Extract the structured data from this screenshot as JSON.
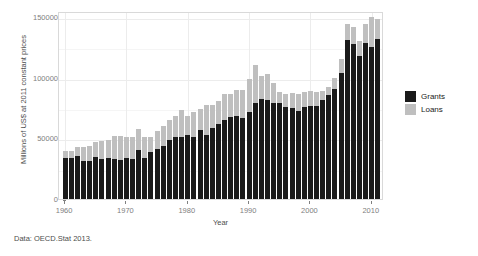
{
  "figure": {
    "title_cut": "",
    "caption": "Data: OECD.Stat 2013.",
    "colors": {
      "grants": "#1a1a1a",
      "loans": "#bfbfbf",
      "panel_background": "#ffffff",
      "panel_border": "#d9d9d9",
      "gridline": "#ececec",
      "axis_text": "#808080",
      "label_text": "#4d4d4d"
    }
  },
  "legend": {
    "entries": [
      {
        "label": "Grants",
        "color": "#1a1a1a"
      },
      {
        "label": "Loans",
        "color": "#bfbfbf"
      }
    ]
  },
  "chart_data": {
    "type": "bar",
    "title": "",
    "xlabel": "Year",
    "ylabel": "Millions of US$ at 2011 constant prices",
    "stacked": true,
    "grid": true,
    "legend_position": "right",
    "xlim": [
      1959,
      2012
    ],
    "ylim": [
      0,
      155000
    ],
    "ytick_labels": [
      "0",
      "50000",
      "100000",
      "150000"
    ],
    "ytick_values": [
      0,
      50000,
      100000,
      150000
    ],
    "xtick_labels": [
      "1960",
      "1970",
      "1980",
      "1990",
      "2000",
      "2010"
    ],
    "xtick_values": [
      1960,
      1970,
      1980,
      1990,
      2000,
      2010
    ],
    "categories": [
      1960,
      1961,
      1962,
      1963,
      1964,
      1965,
      1966,
      1967,
      1968,
      1969,
      1970,
      1971,
      1972,
      1973,
      1974,
      1975,
      1976,
      1977,
      1978,
      1979,
      1980,
      1981,
      1982,
      1983,
      1984,
      1985,
      1986,
      1987,
      1988,
      1989,
      1990,
      1991,
      1992,
      1993,
      1994,
      1995,
      1996,
      1997,
      1998,
      1999,
      2000,
      2001,
      2002,
      2003,
      2004,
      2005,
      2006,
      2007,
      2008,
      2009,
      2010,
      2011
    ],
    "series": [
      {
        "name": "Grants",
        "color": "#1a1a1a",
        "values": [
          34000,
          34000,
          35500,
          31500,
          31000,
          34500,
          33000,
          33500,
          33000,
          32500,
          33500,
          33000,
          40000,
          34000,
          38500,
          41500,
          43500,
          48500,
          51500,
          51000,
          52500,
          51500,
          56500,
          53000,
          58500,
          62000,
          65000,
          67500,
          68500,
          66500,
          72000,
          79500,
          82500,
          82000,
          79500,
          79500,
          75500,
          75000,
          72500,
          75500,
          76500,
          76500,
          81500,
          85500,
          91000,
          103500,
          131500,
          128000,
          117500,
          129000,
          125500,
          132000
        ]
      },
      {
        "name": "Loans",
        "color": "#bfbfbf",
        "values": [
          5500,
          5500,
          7500,
          11500,
          13000,
          12500,
          15000,
          15500,
          19000,
          19500,
          17500,
          18000,
          17500,
          17000,
          13000,
          14500,
          16500,
          17000,
          17000,
          22000,
          16000,
          20000,
          18000,
          24500,
          19000,
          19000,
          21500,
          19500,
          21500,
          23500,
          27000,
          31000,
          19000,
          21000,
          16500,
          8500,
          11500,
          12500,
          14500,
          13000,
          12500,
          11500,
          7500,
          7000,
          9000,
          12000,
          13000,
          13500,
          13000,
          15000,
          24500,
          16500
        ]
      }
    ]
  }
}
